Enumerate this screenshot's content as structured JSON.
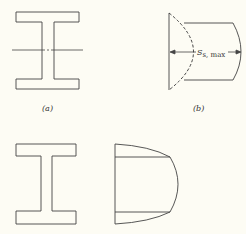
{
  "figure": {
    "panels": [
      {
        "id": "a",
        "label": "(a)",
        "description": "I-beam cross-section with neutral axis"
      },
      {
        "id": "b",
        "label": "(b)",
        "description": "Shear stress distribution with maximum shear"
      },
      {
        "id": "c",
        "label": "",
        "description": "I-beam cross-section"
      },
      {
        "id": "d",
        "label": "",
        "description": "Shear stress distribution over web and flanges"
      }
    ],
    "annotation": {
      "symbol": "S",
      "subscript": "s, max"
    },
    "colors": {
      "line": "#444444",
      "background": "#fdfcf4"
    }
  }
}
